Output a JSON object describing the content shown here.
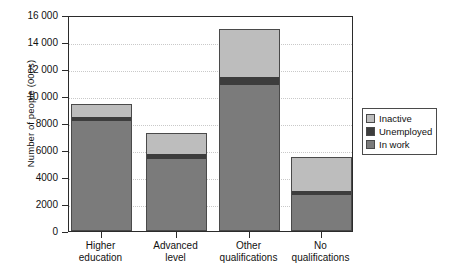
{
  "chart_data": {
    "type": "bar",
    "stacked": true,
    "title": "",
    "xlabel": "",
    "ylabel": "Number of people (000s)",
    "categories": [
      "Higher education",
      "Advanced level",
      "Other qualifications",
      "No qualifications"
    ],
    "category_lines": [
      [
        "Higher",
        "education"
      ],
      [
        "Advanced",
        "level"
      ],
      [
        "Other",
        "qualifications"
      ],
      [
        "No",
        "qualifications"
      ]
    ],
    "series": [
      {
        "name": "In work",
        "color": "#7b7b7b",
        "values": [
          8150,
          5350,
          10800,
          2650
        ]
      },
      {
        "name": "Unemployed",
        "color": "#3d3d3d",
        "values": [
          300,
          350,
          600,
          300
        ]
      },
      {
        "name": "Inactive",
        "color": "#bdbdbd",
        "values": [
          950,
          1550,
          3600,
          2500
        ]
      }
    ],
    "totals": [
      9400,
      7250,
      15000,
      5450
    ],
    "ylim": [
      0,
      16000
    ],
    "yticks": [
      0,
      2000,
      4000,
      6000,
      8000,
      10000,
      12000,
      14000,
      16000
    ],
    "ytick_labels": [
      "0",
      "2000",
      "4000",
      "6000",
      "8000",
      "10 000",
      "12 000",
      "14 000",
      "16 000"
    ],
    "grid": "horizontal-dotted",
    "legend_position": "right",
    "legend_order": [
      "Inactive",
      "Unemployed",
      "In work"
    ]
  },
  "legend": {
    "items": [
      {
        "label": "Inactive",
        "color": "#bdbdbd"
      },
      {
        "label": "Unemployed",
        "color": "#3d3d3d"
      },
      {
        "label": "In work",
        "color": "#7b7b7b"
      }
    ]
  },
  "footnote": {
    "text": ""
  }
}
